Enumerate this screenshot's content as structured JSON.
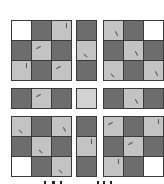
{
  "figure": {
    "colors": {
      "white": "#ffffff",
      "dark": "#6d6d6d",
      "light": "#c3c3c3",
      "center": "#d2d2d2",
      "border": "#3a3a3a"
    },
    "blocks": [
      {
        "id": "top-left",
        "x": 11,
        "y": 20,
        "cols": 3,
        "rows": 3,
        "cells": [
          "w",
          "d",
          "l",
          "d",
          "l",
          "d",
          "l",
          "d",
          "l"
        ]
      },
      {
        "id": "top-middle",
        "x": 76,
        "y": 20,
        "cols": 1,
        "rows": 3,
        "cells": [
          "d",
          "l",
          "d"
        ]
      },
      {
        "id": "top-right",
        "x": 103,
        "y": 20,
        "cols": 3,
        "rows": 3,
        "cells": [
          "l",
          "d",
          "w",
          "d",
          "l",
          "d",
          "l",
          "d",
          "l"
        ]
      },
      {
        "id": "middle-left",
        "x": 11,
        "y": 88,
        "cols": 3,
        "rows": 1,
        "cells": [
          "d",
          "l",
          "d"
        ]
      },
      {
        "id": "center",
        "x": 76,
        "y": 88,
        "cols": 1,
        "rows": 1,
        "cells": [
          "x"
        ]
      },
      {
        "id": "middle-right",
        "x": 103,
        "y": 88,
        "cols": 3,
        "rows": 1,
        "cells": [
          "d",
          "l",
          "d"
        ]
      },
      {
        "id": "bottom-left",
        "x": 11,
        "y": 116,
        "cols": 3,
        "rows": 3,
        "cells": [
          "l",
          "d",
          "l",
          "d",
          "l",
          "d",
          "w",
          "d",
          "l"
        ]
      },
      {
        "id": "bottom-middle",
        "x": 76,
        "y": 116,
        "cols": 1,
        "rows": 3,
        "cells": [
          "d",
          "l",
          "d"
        ]
      },
      {
        "id": "bottom-right",
        "x": 103,
        "y": 116,
        "cols": 3,
        "rows": 3,
        "cells": [
          "l",
          "d",
          "l",
          "d",
          "l",
          "d",
          "l",
          "d",
          "w"
        ]
      }
    ],
    "caption": ""
  }
}
